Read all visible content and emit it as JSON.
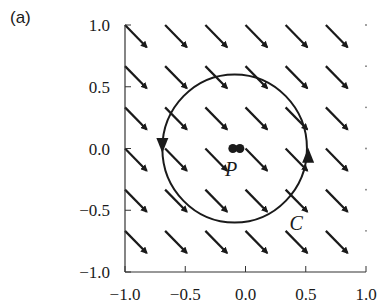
{
  "panel": {
    "label": "(a)"
  },
  "chart_data": {
    "type": "quiver",
    "title": "",
    "xlabel": "",
    "ylabel": "",
    "xlim": [
      -1.0,
      1.0
    ],
    "ylim": [
      -1.0,
      1.0
    ],
    "grid": false,
    "xticks": [
      -1.0,
      -0.5,
      0.0,
      0.5,
      1.0
    ],
    "xtick_labels": [
      "−1.0",
      "−0.5",
      "0.0",
      "0.5",
      "1.0"
    ],
    "yticks": [
      -1.0,
      -0.5,
      0.0,
      0.5,
      1.0
    ],
    "ytick_labels": [
      "−1.0",
      "−0.5",
      "0.0",
      "0.5",
      "1.0"
    ],
    "vector_field": {
      "description": "uniform field pointing down-right",
      "direction": [
        1,
        -1
      ],
      "grid_x": [
        -1.0,
        -0.667,
        -0.333,
        0.0,
        0.333,
        0.667,
        1.0
      ],
      "grid_y": [
        1.0,
        0.667,
        0.333,
        0.0,
        -0.333,
        -0.667
      ],
      "arrow_length": 0.36
    },
    "curve": {
      "name": "C",
      "shape": "circle",
      "center": [
        -0.09,
        0.0
      ],
      "radius": 0.6,
      "orientation": "counterclockwise",
      "direction_markers": [
        {
          "position": [
            -0.69,
            0.02
          ],
          "points": "down"
        },
        {
          "position": [
            0.52,
            -0.05
          ],
          "points": "up"
        }
      ]
    },
    "point": {
      "name": "P",
      "position": [
        -0.08,
        0.0
      ],
      "marker": "double-dot"
    },
    "annotations": [
      {
        "text": "P",
        "position": [
          -0.12,
          -0.17
        ]
      },
      {
        "text": "C",
        "position": [
          0.42,
          -0.6
        ]
      }
    ]
  }
}
